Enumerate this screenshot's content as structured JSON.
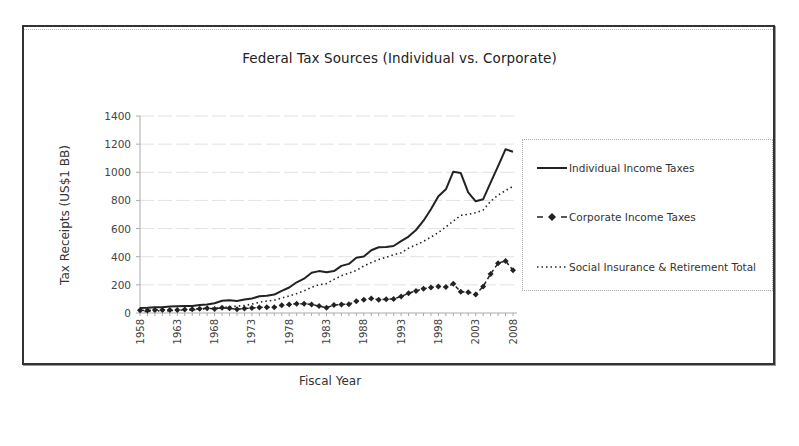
{
  "chart_data": {
    "type": "line",
    "title": "Federal Tax Sources (Individual vs. Corporate)",
    "xlabel": "Fiscal Year",
    "ylabel": "Tax Receipts (US$1 BB)",
    "ylim": [
      0,
      1400
    ],
    "yticks": [
      0,
      200,
      400,
      600,
      800,
      1000,
      1200,
      1400
    ],
    "xticks": [
      "1958",
      "1963",
      "1968",
      "1973",
      "1978",
      "1983",
      "1988",
      "1993",
      "1998",
      "2003",
      "2008"
    ],
    "grid": true,
    "legend_position": "right",
    "x": [
      1958,
      1959,
      1960,
      1961,
      1962,
      1963,
      1964,
      1965,
      1966,
      1967,
      1968,
      1969,
      1970,
      1971,
      1972,
      1973,
      1974,
      1975,
      1976,
      1977,
      1978,
      1979,
      1980,
      1981,
      1982,
      1983,
      1984,
      1985,
      1986,
      1987,
      1988,
      1989,
      1990,
      1991,
      1992,
      1993,
      1994,
      1995,
      1996,
      1997,
      1998,
      1999,
      2000,
      2001,
      2002,
      2003,
      2004,
      2005,
      2006,
      2007,
      2008
    ],
    "series": [
      {
        "name": "Individual Income Taxes",
        "style": "solid",
        "values": [
          35,
          37,
          41,
          41,
          46,
          48,
          49,
          49,
          56,
          61,
          69,
          87,
          90,
          86,
          95,
          103,
          119,
          122,
          131,
          157,
          181,
          218,
          244,
          286,
          298,
          289,
          298,
          335,
          349,
          393,
          401,
          446,
          467,
          468,
          476,
          510,
          543,
          590,
          656,
          737,
          829,
          879,
          1004,
          994,
          858,
          794,
          809,
          927,
          1044,
          1163,
          1146
        ]
      },
      {
        "name": "Corporate Income Taxes",
        "style": "dashed-diamond",
        "values": [
          20,
          17,
          21,
          21,
          21,
          22,
          24,
          26,
          30,
          34,
          29,
          37,
          33,
          27,
          32,
          36,
          39,
          41,
          41,
          55,
          60,
          66,
          65,
          61,
          49,
          37,
          57,
          61,
          63,
          84,
          94,
          103,
          94,
          98,
          100,
          118,
          140,
          157,
          172,
          182,
          189,
          184,
          207,
          151,
          148,
          132,
          189,
          278,
          354,
          370,
          304
        ]
      },
      {
        "name": "Social Insurance & Retirement Total",
        "style": "dotted",
        "values": [
          11,
          12,
          14,
          16,
          17,
          19,
          22,
          22,
          25,
          32,
          34,
          39,
          44,
          48,
          53,
          63,
          76,
          85,
          91,
          106,
          121,
          138,
          157,
          183,
          201,
          209,
          239,
          265,
          283,
          303,
          334,
          359,
          380,
          396,
          414,
          428,
          461,
          484,
          509,
          539,
          572,
          612,
          653,
          694,
          701,
          713,
          733,
          794,
          838,
          870,
          900
        ]
      }
    ]
  },
  "legend": {
    "items": [
      {
        "label": "Individual Income Taxes"
      },
      {
        "label": "Corporate Income Taxes"
      },
      {
        "label": "Social Insurance & Retirement Total"
      }
    ]
  },
  "colors": {
    "line": "#222222",
    "grid": "#e2e2e2",
    "axis": "#aaaaaa",
    "frame": "#333333"
  }
}
